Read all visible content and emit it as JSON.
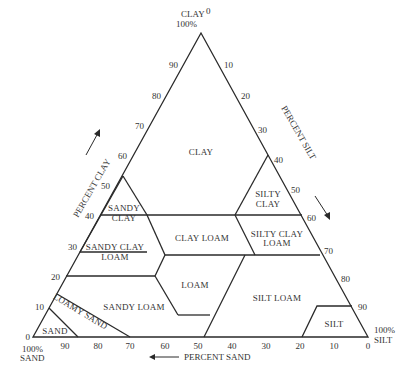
{
  "diagram": {
    "vertices": {
      "top": {
        "line1": "CLAY",
        "line2": "100%"
      },
      "bottom_left": {
        "line1": "100%",
        "line2": "SAND"
      },
      "bottom_right": {
        "line1": "100%",
        "line2": "SILT"
      }
    },
    "axes": {
      "clay": {
        "label": "PERCENT CLAY",
        "ticks": [
          "0",
          "10",
          "20",
          "30",
          "40",
          "50",
          "60",
          "70",
          "80",
          "90"
        ]
      },
      "silt": {
        "label": "PERCENT SILT",
        "ticks": [
          "0",
          "10",
          "20",
          "30",
          "40",
          "50",
          "60",
          "70",
          "80",
          "90"
        ]
      },
      "sand": {
        "label": "PERCENT SAND",
        "ticks": [
          "90",
          "80",
          "70",
          "60",
          "50",
          "40",
          "30",
          "20",
          "10",
          "0"
        ]
      }
    },
    "regions": {
      "clay": "CLAY",
      "sandy_clay": [
        "SANDY",
        "CLAY"
      ],
      "silty_clay": [
        "SILTY",
        "CLAY"
      ],
      "sandy_clay_loam": [
        "SANDY CLAY",
        "LOAM"
      ],
      "clay_loam": "CLAY LOAM",
      "silty_clay_loam": [
        "SILTY CLAY",
        "LOAM"
      ],
      "loam": "LOAM",
      "sandy_loam": "SANDY LOAM",
      "silt_loam": "SILT LOAM",
      "loamy_sand": "LOAMY SAND",
      "sand": "SAND",
      "silt": "SILT"
    },
    "line_color": "#2a2a2a",
    "text_color": "#333333"
  }
}
